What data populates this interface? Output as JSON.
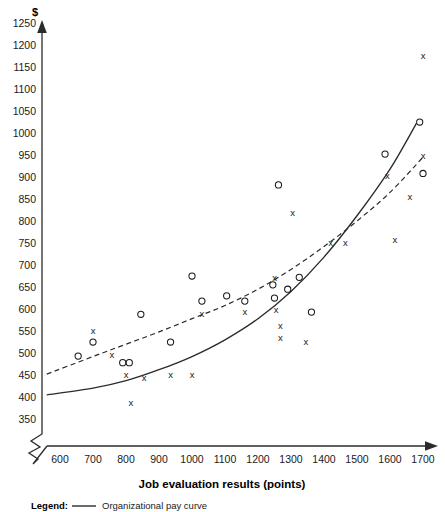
{
  "chart_data": {
    "type": "scatter",
    "title": "",
    "xlabel": "Job evaluation results (points)",
    "ylabel": "$",
    "xlim": [
      550,
      1760
    ],
    "ylim": [
      340,
      1270
    ],
    "xticks": [
      600,
      700,
      800,
      900,
      1000,
      1100,
      1200,
      1300,
      1400,
      1500,
      1600,
      1700
    ],
    "yticks": [
      350,
      400,
      450,
      500,
      550,
      600,
      650,
      700,
      750,
      800,
      850,
      900,
      950,
      1000,
      1050,
      1100,
      1150,
      1200,
      1250
    ],
    "grid": false,
    "axis_break": true,
    "legend_position": "below-axis",
    "series": [
      {
        "name": "x-markers",
        "marker": "x",
        "points": [
          [
            700,
            552
          ],
          [
            757,
            497
          ],
          [
            800,
            450
          ],
          [
            815,
            388
          ],
          [
            855,
            443
          ],
          [
            935,
            452
          ],
          [
            1000,
            452
          ],
          [
            1030,
            590
          ],
          [
            1160,
            593
          ],
          [
            1250,
            672
          ],
          [
            1255,
            598
          ],
          [
            1268,
            563
          ],
          [
            1268,
            535
          ],
          [
            1305,
            818
          ],
          [
            1345,
            527
          ],
          [
            1420,
            752
          ],
          [
            1465,
            752
          ],
          [
            1615,
            758
          ],
          [
            1660,
            855
          ],
          [
            1700,
            1175
          ],
          [
            1700,
            948
          ],
          [
            1592,
            903
          ]
        ]
      },
      {
        "name": "o-markers",
        "marker": "o",
        "points": [
          [
            655,
            493
          ],
          [
            700,
            525
          ],
          [
            790,
            478
          ],
          [
            810,
            478
          ],
          [
            845,
            588
          ],
          [
            935,
            525
          ],
          [
            1000,
            675
          ],
          [
            1030,
            618
          ],
          [
            1105,
            630
          ],
          [
            1160,
            618
          ],
          [
            1245,
            655
          ],
          [
            1250,
            625
          ],
          [
            1262,
            882
          ],
          [
            1290,
            645
          ],
          [
            1325,
            672
          ],
          [
            1362,
            593
          ],
          [
            1585,
            952
          ],
          [
            1690,
            1025
          ],
          [
            1700,
            908
          ]
        ]
      }
    ],
    "curves": [
      {
        "name": "Organizational pay curve",
        "style": "solid",
        "points": [
          [
            560,
            405
          ],
          [
            700,
            420
          ],
          [
            800,
            437
          ],
          [
            900,
            462
          ],
          [
            1000,
            492
          ],
          [
            1100,
            530
          ],
          [
            1200,
            578
          ],
          [
            1300,
            640
          ],
          [
            1400,
            718
          ],
          [
            1500,
            812
          ],
          [
            1600,
            918
          ],
          [
            1680,
            1022
          ]
        ]
      },
      {
        "name": "Market pay curve",
        "style": "dashed",
        "points": [
          [
            560,
            452
          ],
          [
            700,
            492
          ],
          [
            800,
            520
          ],
          [
            900,
            548
          ],
          [
            1000,
            578
          ],
          [
            1100,
            608
          ],
          [
            1200,
            645
          ],
          [
            1300,
            690
          ],
          [
            1400,
            742
          ],
          [
            1500,
            800
          ],
          [
            1600,
            865
          ],
          [
            1700,
            945
          ]
        ]
      }
    ]
  },
  "axis": {
    "y_unit_symbol": "$",
    "x_title": "Job evaluation results (points)"
  },
  "legend": {
    "label": "Legend:",
    "entries": [
      {
        "text": "Organizational pay curve",
        "style": "solid"
      }
    ]
  }
}
